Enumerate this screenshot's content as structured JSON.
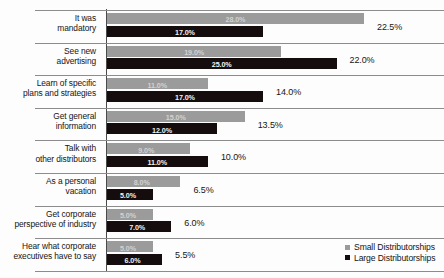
{
  "chart_data": {
    "type": "bar",
    "orientation": "horizontal",
    "title": "",
    "xlabel": "",
    "ylabel": "",
    "grid": true,
    "legend_position": "bottom-right",
    "categories": [
      "It was\nmandatory",
      "See new\nadvertising",
      "Learn of specific\nplans and strategies",
      "Get general\ninformation",
      "Talk with\nother distributors",
      "As a personal\nvacation",
      "Get corporate\nperspective of industry",
      "Hear what corporate\nexecutives have to say"
    ],
    "series": [
      {
        "name": "Small Distributorships",
        "color": "#9b9b9b",
        "values": [
          28.0,
          19.0,
          11.0,
          15.0,
          9.0,
          8.0,
          5.0,
          5.0
        ],
        "labels": [
          "28.0%",
          "19.0%",
          "11.0%",
          "15.0%",
          "9.0%",
          "8.0%",
          "5.0%",
          "5.0%"
        ]
      },
      {
        "name": "Large Distributorships",
        "color": "#150d0d",
        "values": [
          17.0,
          25.0,
          17.0,
          12.0,
          11.0,
          5.0,
          7.0,
          6.0
        ],
        "labels": [
          "17.0%",
          "25.0%",
          "17.0%",
          "12.0%",
          "11.0%",
          "5.0%",
          "7.0%",
          "6.0%"
        ]
      }
    ],
    "group_totals": {
      "name": "Overall",
      "values": [
        22.5,
        22.0,
        14.0,
        13.5,
        10.0,
        6.5,
        6.0,
        5.5
      ],
      "labels": [
        "22.5%",
        "22.0%",
        "14.0%",
        "13.5%",
        "10.0%",
        "6.5%",
        "6.0%",
        "5.5%"
      ]
    },
    "xlim": [
      0,
      28
    ]
  },
  "legend": {
    "items": [
      {
        "label": "Small Distributorships",
        "color": "#9b9b9b"
      },
      {
        "label": "Large Distributorships",
        "color": "#150d0d"
      }
    ]
  }
}
